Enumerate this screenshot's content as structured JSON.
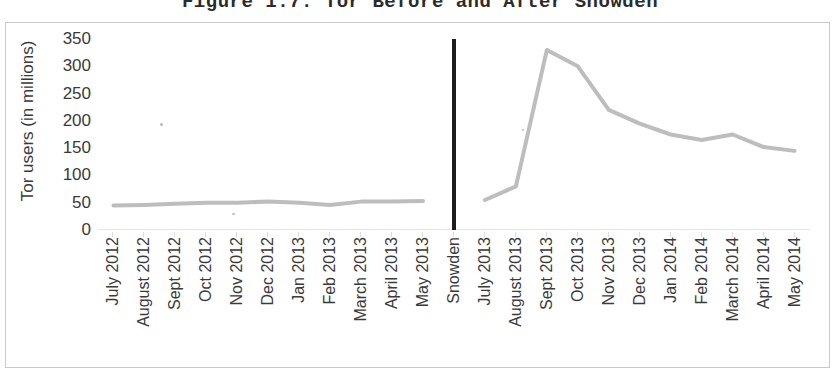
{
  "figure": {
    "title": "Figure 1.7: Tor Before and After Snowden"
  },
  "chart_data": {
    "type": "line",
    "title": "Figure 1.7: Tor Before and After Snowden",
    "xlabel": "",
    "ylabel": "Tor users (in millions)",
    "ylim": [
      0,
      350
    ],
    "y_ticks": [
      0,
      50,
      100,
      150,
      200,
      250,
      300,
      350
    ],
    "y_tick_labels": [
      "0",
      "50",
      "100",
      "150",
      "200",
      "250",
      "300",
      "350"
    ],
    "grid": false,
    "legend": "none",
    "line_color": "#bdbdbd",
    "divider_color": "#1d1d1d",
    "divider_category": "Snowden",
    "categories": [
      "July 2012",
      "August 2012",
      "Sept 2012",
      "Oct 2012",
      "Nov 2012",
      "Dec 2012",
      "Jan 2013",
      "Feb 2013",
      "March 2013",
      "April 2013",
      "May 2013",
      "Snowden",
      "July 2013",
      "August 2013",
      "Sept 2013",
      "Oct 2013",
      "Nov 2013",
      "Dec 2013",
      "Jan 2014",
      "Feb 2014",
      "March 2014",
      "April 2014",
      "May 2014"
    ],
    "values": [
      45,
      46,
      48,
      50,
      50,
      52,
      50,
      46,
      52,
      52,
      53,
      null,
      55,
      80,
      330,
      300,
      220,
      195,
      175,
      165,
      175,
      152,
      145
    ],
    "series": [
      {
        "name": "Tor users",
        "segments": [
          {
            "name": "before-snowden",
            "categories": [
              "July 2012",
              "August 2012",
              "Sept 2012",
              "Oct 2012",
              "Nov 2012",
              "Dec 2012",
              "Jan 2013",
              "Feb 2013",
              "March 2013",
              "April 2013",
              "May 2013"
            ],
            "values": [
              45,
              46,
              48,
              50,
              50,
              52,
              50,
              46,
              52,
              52,
              53
            ]
          },
          {
            "name": "after-snowden",
            "categories": [
              "July 2013",
              "August 2013",
              "Sept 2013",
              "Oct 2013",
              "Nov 2013",
              "Dec 2013",
              "Jan 2014",
              "Feb 2014",
              "March 2014",
              "April 2014",
              "May 2014"
            ],
            "values": [
              55,
              80,
              330,
              300,
              220,
              195,
              175,
              165,
              175,
              152,
              145
            ]
          }
        ]
      }
    ]
  }
}
